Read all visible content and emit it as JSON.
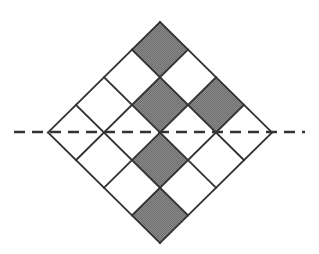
{
  "figure": {
    "canvas": {
      "width": 319,
      "height": 254,
      "background": "#ffffff"
    },
    "colors": {
      "shaded_fill": "#808080",
      "unshaded_fill": "#ffffff",
      "stroke": "#333333",
      "dash_stroke": "#333333"
    },
    "geometry": {
      "grid_rows": 4,
      "grid_cols": 4,
      "rotation_degrees": 45,
      "top_vertex": {
        "x": 160,
        "y": 22
      },
      "right_vertex": {
        "x": 272,
        "y": 132
      },
      "bottom_vertex": {
        "x": 160,
        "y": 243
      },
      "left_vertex": {
        "x": 48,
        "y": 132
      },
      "cell_half_step_x": 28,
      "cell_half_step_y": 27.625,
      "stroke_width": 1.8
    },
    "dashed_line": {
      "name": "axis-of-symmetry",
      "x1": 14,
      "x2": 305,
      "y": 132,
      "dash_pattern": "11 7",
      "stroke_width": 2.4
    },
    "cells": [
      {
        "row": 0,
        "col": 0,
        "shaded": true
      },
      {
        "row": 0,
        "col": 1,
        "shaded": false
      },
      {
        "row": 0,
        "col": 2,
        "shaded": false
      },
      {
        "row": 0,
        "col": 3,
        "shaded": false
      },
      {
        "row": 1,
        "col": 0,
        "shaded": false
      },
      {
        "row": 1,
        "col": 1,
        "shaded": true
      },
      {
        "row": 1,
        "col": 2,
        "shaded": false
      },
      {
        "row": 1,
        "col": 3,
        "shaded": false
      },
      {
        "row": 2,
        "col": 0,
        "shaded": true
      },
      {
        "row": 2,
        "col": 1,
        "shaded": false
      },
      {
        "row": 2,
        "col": 2,
        "shaded": true
      },
      {
        "row": 2,
        "col": 3,
        "shaded": false
      },
      {
        "row": 3,
        "col": 0,
        "shaded": false
      },
      {
        "row": 3,
        "col": 1,
        "shaded": false
      },
      {
        "row": 3,
        "col": 2,
        "shaded": false
      },
      {
        "row": 3,
        "col": 3,
        "shaded": true
      }
    ],
    "shaded_count": 6,
    "total_cells": 16
  }
}
